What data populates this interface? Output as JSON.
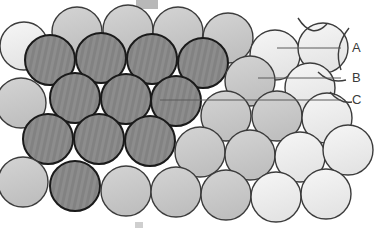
{
  "figure": {
    "width": 377,
    "height": 230,
    "background_color": "#ffffff"
  },
  "colors": {
    "sphere_light": "#eeeeee",
    "sphere_mid": "#c9c9c9",
    "sphere_dark": "#8a8a8a",
    "sphere_dark_stripe": "#7e7e7e",
    "outline": "#1a1a1a",
    "outline_soft": "#3c3c3c",
    "leader_line": "#5a5a5a",
    "label_text": "#3a3a3a",
    "artifact_gray": "#b8b8b8"
  },
  "labels": [
    {
      "id": "A",
      "text": "A",
      "x": 352,
      "y": 52,
      "leader_x1": 277,
      "leader_x2": 341,
      "leader_y": 48
    },
    {
      "id": "B",
      "text": "B",
      "x": 352,
      "y": 82,
      "leader_x1": 258,
      "leader_x2": 341,
      "leader_y": 78
    },
    {
      "id": "C",
      "text": "C",
      "x": 352,
      "y": 104,
      "leader_x1": 160,
      "leader_x2": 341,
      "leader_y": 100
    }
  ],
  "legend_meaning": {
    "A": "light sphere (top layer / A position)",
    "B": "mid-tone sphere (B position)",
    "C": "dark striped sphere (C position)"
  },
  "spheres": [
    {
      "cx": 24,
      "cy": 46,
      "r": 24,
      "tone": "light"
    },
    {
      "cx": 77,
      "cy": 32,
      "r": 25,
      "tone": "mid"
    },
    {
      "cx": 128,
      "cy": 30,
      "r": 25,
      "tone": "mid"
    },
    {
      "cx": 178,
      "cy": 32,
      "r": 25,
      "tone": "mid"
    },
    {
      "cx": 228,
      "cy": 38,
      "r": 25,
      "tone": "mid"
    },
    {
      "cx": 275,
      "cy": 55,
      "r": 25,
      "tone": "light"
    },
    {
      "cx": 323,
      "cy": 48,
      "r": 25,
      "tone": "light"
    },
    {
      "cx": 50,
      "cy": 60,
      "r": 25,
      "tone": "dark"
    },
    {
      "cx": 101,
      "cy": 58,
      "r": 25,
      "tone": "dark"
    },
    {
      "cx": 152,
      "cy": 59,
      "r": 25,
      "tone": "dark"
    },
    {
      "cx": 203,
      "cy": 63,
      "r": 25,
      "tone": "dark"
    },
    {
      "cx": 250,
      "cy": 81,
      "r": 25,
      "tone": "mid"
    },
    {
      "cx": 310,
      "cy": 88,
      "r": 25,
      "tone": "light"
    },
    {
      "cx": 21,
      "cy": 103,
      "r": 25,
      "tone": "mid"
    },
    {
      "cx": 75,
      "cy": 98,
      "r": 25,
      "tone": "dark"
    },
    {
      "cx": 126,
      "cy": 99,
      "r": 25,
      "tone": "dark"
    },
    {
      "cx": 176,
      "cy": 101,
      "r": 25,
      "tone": "dark"
    },
    {
      "cx": 226,
      "cy": 116,
      "r": 25,
      "tone": "mid"
    },
    {
      "cx": 277,
      "cy": 116,
      "r": 25,
      "tone": "mid"
    },
    {
      "cx": 327,
      "cy": 118,
      "r": 25,
      "tone": "light"
    },
    {
      "cx": 48,
      "cy": 139,
      "r": 25,
      "tone": "dark"
    },
    {
      "cx": 99,
      "cy": 139,
      "r": 25,
      "tone": "dark"
    },
    {
      "cx": 150,
      "cy": 141,
      "r": 25,
      "tone": "dark"
    },
    {
      "cx": 200,
      "cy": 152,
      "r": 25,
      "tone": "mid"
    },
    {
      "cx": 250,
      "cy": 155,
      "r": 25,
      "tone": "mid"
    },
    {
      "cx": 300,
      "cy": 157,
      "r": 25,
      "tone": "light"
    },
    {
      "cx": 348,
      "cy": 150,
      "r": 25,
      "tone": "light"
    },
    {
      "cx": 23,
      "cy": 182,
      "r": 25,
      "tone": "mid"
    },
    {
      "cx": 75,
      "cy": 186,
      "r": 25,
      "tone": "dark"
    },
    {
      "cx": 126,
      "cy": 191,
      "r": 25,
      "tone": "mid"
    },
    {
      "cx": 176,
      "cy": 192,
      "r": 25,
      "tone": "mid"
    },
    {
      "cx": 226,
      "cy": 195,
      "r": 25,
      "tone": "mid"
    },
    {
      "cx": 276,
      "cy": 197,
      "r": 25,
      "tone": "light"
    },
    {
      "cx": 326,
      "cy": 194,
      "r": 25,
      "tone": "light"
    }
  ],
  "partial_arcs": [
    {
      "d": "M 298 18 Q 312 40 327 24",
      "note": "upper right partial sphere outline"
    },
    {
      "d": "M 349 28 Q 333 48 341 70",
      "note": "right edge partial arc"
    },
    {
      "d": "M 318 72 Q 330 84 346 80",
      "note": "right mid partial arc"
    },
    {
      "d": "M 330 92 Q 340 104 352 102",
      "note": "right lower partial arc"
    }
  ],
  "artifacts": [
    {
      "name": "top-gray-mark",
      "x": 136,
      "y": 0,
      "width": 22,
      "height": 9,
      "color": "#b8b8b8"
    },
    {
      "name": "bottom-faint-mark",
      "x": 135,
      "y": 222,
      "width": 8,
      "height": 6,
      "color": "#cfcfcf"
    }
  ]
}
